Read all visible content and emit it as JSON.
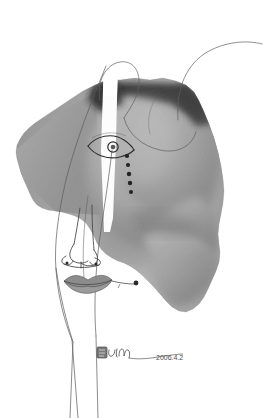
{
  "artwork": {
    "title": "Untitled face collage",
    "medium_description": "Torn grayscale photographic fragment collaged with pen line drawing of a face",
    "canvas": {
      "width": 266,
      "height": 418,
      "background_color": "#ffffff"
    },
    "palette": {
      "background": "#ffffff",
      "paper_white": "#fdfdfd",
      "photo_light_gray": "#b9b9b9",
      "photo_mid_gray": "#9a9a9a",
      "photo_dark_gray": "#6e6e6e",
      "photo_shadow": "#3a3a3a",
      "photo_near_black": "#141414",
      "ink_line": "#4a4a4a",
      "ink_dark": "#2b2b2b",
      "lips_fill": "#8f8f8f",
      "signature_ink": "#5a5a5a"
    },
    "elements": [
      {
        "name": "photo-fragment",
        "label": "Torn photographic paper fragment",
        "description": "Irregular torn-edge grayscale photograph of body forms occupying the center and right of the composition"
      },
      {
        "name": "white-vertical-strip",
        "label": "White vertical strip",
        "description": "Narrow light band running from top through the photo fragment, splitting the face"
      },
      {
        "name": "eye-drawing",
        "label": "Eye",
        "description": "Almond outline eye with circular iris, drawn in ink over the photograph"
      },
      {
        "name": "tear-dots",
        "label": "Tear dots",
        "description": "Column of five small dark dots descending from the eye",
        "count": 5
      },
      {
        "name": "nose-drawing",
        "label": "Nose",
        "description": "Outlined nose in profile-front hybrid view"
      },
      {
        "name": "lips-drawing",
        "label": "Lips",
        "description": "Gray filled lips with a thin stem extending to the right ending in a small knob"
      },
      {
        "name": "face-contour-lines",
        "label": "Face contour lines",
        "description": "Long thin curving ink lines describing the head, cheek and neck, continuing past the bottom of the photo"
      },
      {
        "name": "hair-strand-lines",
        "label": "Hair strand lines",
        "description": "Thin arcing lines at the top of the composition"
      }
    ],
    "signature": {
      "name": "artist-signature",
      "text": "Lin",
      "date_text": "2006.4.2",
      "label": "Artist signature and date"
    }
  }
}
